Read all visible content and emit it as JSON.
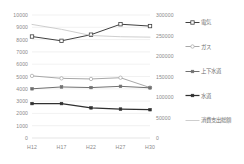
{
  "chart_data": {
    "type": "line",
    "title": "",
    "xlabel": "",
    "ylabel": "",
    "grid": true,
    "legend_position": "right",
    "categories": [
      "H12",
      "H17",
      "H22",
      "H27",
      "H30"
    ],
    "y_left": {
      "min": 0,
      "max": 10000,
      "ticks": [
        0,
        1000,
        2000,
        3000,
        4000,
        5000,
        6000,
        7000,
        8000,
        9000,
        10000
      ],
      "tick_labels": [
        "0",
        "1000",
        "2000",
        "3000",
        "4000",
        "5000",
        "6000",
        "7000",
        "8000",
        "9000",
        "10000"
      ]
    },
    "y_right": {
      "min": 0,
      "max": 300000,
      "ticks": [
        0,
        50000,
        100000,
        150000,
        200000,
        250000,
        300000
      ],
      "tick_labels": [
        "0",
        "50000",
        "100000",
        "150000",
        "200000",
        "250000",
        "300000"
      ]
    },
    "series": [
      {
        "name": "電気",
        "axis": "left",
        "color": "#404040",
        "marker": "open-square",
        "values": [
          8250,
          7900,
          8400,
          9250,
          9100
        ]
      },
      {
        "name": "ガス",
        "axis": "left",
        "color": "#a8a8a8",
        "marker": "open-circle",
        "values": [
          5050,
          4850,
          4800,
          4900,
          4100
        ]
      },
      {
        "name": "上下水道",
        "axis": "left",
        "color": "#707070",
        "marker": "filled-square",
        "values": [
          4000,
          4150,
          4100,
          4200,
          4080
        ]
      },
      {
        "name": "水道",
        "axis": "left",
        "color": "#303030",
        "marker": "filled-square",
        "values": [
          2800,
          2800,
          2450,
          2350,
          2300
        ]
      },
      {
        "name": "消費支出総額",
        "axis": "right",
        "color": "#bdbdbd",
        "marker": "none",
        "values": [
          277000,
          265000,
          250000,
          247000,
          246000
        ]
      }
    ]
  },
  "legend": {
    "items": [
      {
        "label": "電気"
      },
      {
        "label": "ガス"
      },
      {
        "label": "上下水道"
      },
      {
        "label": "水道"
      },
      {
        "label": "消費支出総額"
      }
    ]
  }
}
